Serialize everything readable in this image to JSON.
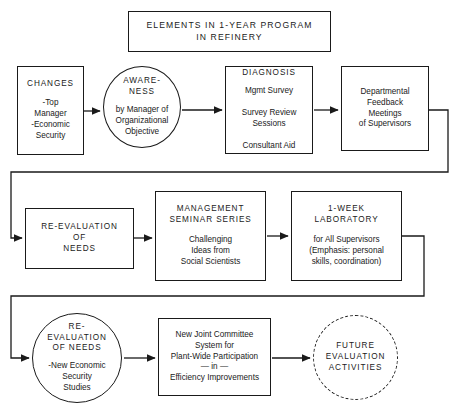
{
  "diagram": {
    "kind": "flowchart",
    "title": {
      "label": "ELEMENTS IN 1-YEAR PROGRAM\nIN REFINERY",
      "shape": "rectangle"
    },
    "ink_color": "#1a1a1a",
    "background_color": "#ffffff",
    "nodes": [
      {
        "id": "changes",
        "shape": "rectangle",
        "heading": "CHANGES",
        "body": "-Top\nManager\n-Economic\nSecurity"
      },
      {
        "id": "awareness",
        "shape": "circle",
        "heading": "AWARE-\nNESS",
        "body": "by Manager of\nOrganizational\nObjective"
      },
      {
        "id": "diagnosis",
        "shape": "rectangle",
        "heading": "DIAGNOSIS",
        "body": "Mgmt Survey\n\nSurvey Review\nSessions\n\nConsultant Aid"
      },
      {
        "id": "departmental-feedback",
        "shape": "rectangle",
        "heading": "",
        "body": "Departmental\nFeedback\nMeetings\nof Supervisors"
      },
      {
        "id": "re-evaluation-of-needs-1",
        "shape": "rectangle",
        "heading": "RE-EVALUATION\nOF\nNEEDS",
        "body": ""
      },
      {
        "id": "management-seminar-series",
        "shape": "rectangle",
        "heading": "MANAGEMENT\nSEMINAR SERIES",
        "body": "Challenging\nIdeas from\nSocial Scientists"
      },
      {
        "id": "one-week-laboratory",
        "shape": "rectangle",
        "heading": "1-WEEK\nLABORATORY",
        "body": "for All Supervisors\n(Emphasis: personal\nskills, coordination)"
      },
      {
        "id": "re-evaluation-of-needs-2",
        "shape": "circle",
        "heading": "RE-\nEVALUATION\nOF  NEEDS",
        "body": "-New Economic\nSecurity\nStudies"
      },
      {
        "id": "new-joint-committee",
        "shape": "rectangle",
        "heading": "",
        "body": "New Joint Committee\nSystem for\nPlant-Wide Participation\n— in —\nEfficiency Improvements"
      },
      {
        "id": "future-evaluation-activities",
        "shape": "circle-dashed",
        "heading": "FUTURE\nEVALUATION\nACTIVITIES",
        "body": ""
      }
    ],
    "edges": [
      {
        "from": "changes",
        "to": "awareness",
        "style": "arrow-right"
      },
      {
        "from": "awareness",
        "to": "diagnosis",
        "style": "arrow-right"
      },
      {
        "from": "diagnosis",
        "to": "departmental-feedback",
        "style": "arrow-right"
      },
      {
        "from": "departmental-feedback",
        "to": "re-evaluation-of-needs-1",
        "style": "elbow-wrap-arrow-right"
      },
      {
        "from": "re-evaluation-of-needs-1",
        "to": "management-seminar-series",
        "style": "arrow-right"
      },
      {
        "from": "management-seminar-series",
        "to": "one-week-laboratory",
        "style": "arrow-right"
      },
      {
        "from": "one-week-laboratory",
        "to": "re-evaluation-of-needs-2",
        "style": "elbow-wrap-arrow-right"
      },
      {
        "from": "re-evaluation-of-needs-2",
        "to": "new-joint-committee",
        "style": "arrow-right"
      },
      {
        "from": "new-joint-committee",
        "to": "future-evaluation-activities",
        "style": "arrow-right"
      }
    ]
  }
}
